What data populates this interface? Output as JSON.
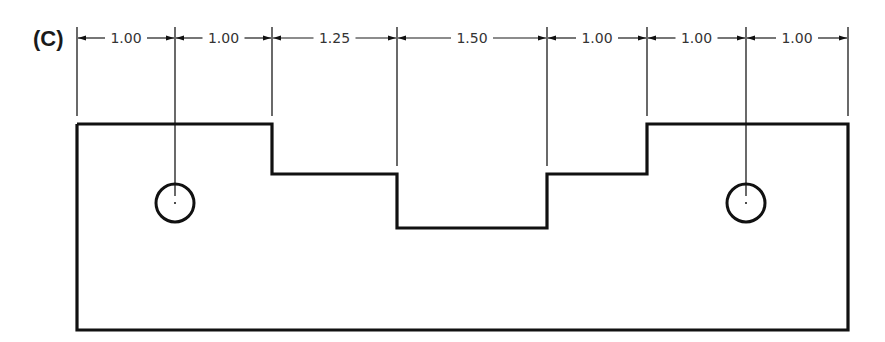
{
  "figure": {
    "label": "(C)",
    "colors": {
      "line": "#111111",
      "text": "#333333",
      "background": "#ffffff"
    },
    "dimension_line_y": 38,
    "extension_lines": [
      {
        "x": 77,
        "y1": 27,
        "y2": 116
      },
      {
        "x": 175,
        "y1": 27,
        "y2": 196
      },
      {
        "x": 272,
        "y1": 27,
        "y2": 116
      },
      {
        "x": 397,
        "y1": 27,
        "y2": 166
      },
      {
        "x": 547,
        "y1": 27,
        "y2": 166
      },
      {
        "x": 647,
        "y1": 27,
        "y2": 116
      },
      {
        "x": 746,
        "y1": 27,
        "y2": 196
      },
      {
        "x": 848,
        "y1": 27,
        "y2": 116
      }
    ],
    "dimensions": [
      {
        "value": "1.00",
        "x1": 77,
        "x2": 175
      },
      {
        "value": "1.00",
        "x1": 175,
        "x2": 272
      },
      {
        "value": "1.25",
        "x1": 272,
        "x2": 397
      },
      {
        "value": "1.50",
        "x1": 397,
        "x2": 547
      },
      {
        "value": "1.00",
        "x1": 547,
        "x2": 647
      },
      {
        "value": "1.00",
        "x1": 647,
        "x2": 746
      },
      {
        "value": "1.00",
        "x1": 746,
        "x2": 848
      }
    ],
    "outline_points": "77,124 272,124 272,174 397,174 397,228 547,228 547,174 647,174 647,124 848,124 848,330 77,330 77,124",
    "holes": [
      {
        "cx": 175,
        "cy": 203,
        "r": 19
      },
      {
        "cx": 746,
        "cy": 203,
        "r": 19
      }
    ]
  }
}
